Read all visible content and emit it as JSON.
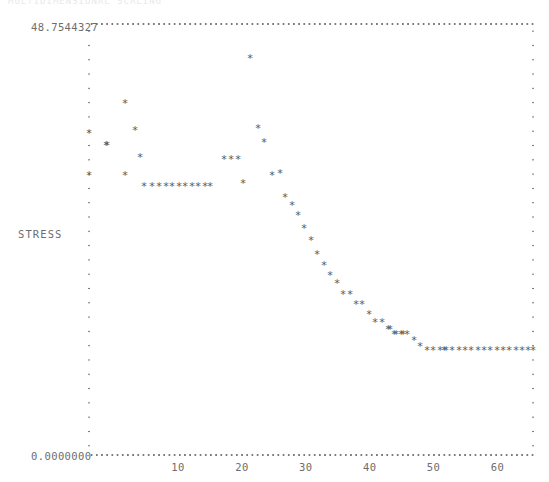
{
  "header": {
    "clipped_text": "MULTIDIMENSIONAL SCALING"
  },
  "axes": {
    "y_max_label": "48.7544327",
    "y_min_label": "0.0000000",
    "y_axis_title": "STRESS",
    "x_tick_labels": [
      "10",
      "20",
      "30",
      "40",
      "50",
      "60",
      "70"
    ],
    "marker_glyph": "*",
    "frame_color": "#7a7a7a",
    "marker_color": "#5a5a5a",
    "text_color": "#6d6d6d"
  },
  "chart_data": {
    "type": "scatter",
    "title": "",
    "xlabel": "",
    "ylabel": "STRESS",
    "xlim": [
      0,
      70
    ],
    "ylim": [
      0.0,
      48.7544327
    ],
    "grid": false,
    "legend": "none",
    "xticks": [
      10,
      20,
      30,
      40,
      50,
      60,
      70
    ],
    "yticks": [
      0.0,
      48.7544327
    ],
    "marker": "*",
    "x": [
      1,
      1,
      2,
      3,
      3,
      4,
      5,
      6,
      7,
      8,
      9,
      10,
      11,
      12,
      13,
      14,
      15,
      16,
      17,
      18,
      19,
      20,
      21,
      22,
      23,
      24,
      25,
      26,
      27,
      28,
      29,
      30,
      31,
      32,
      33,
      34,
      35,
      36,
      37,
      38,
      39,
      40,
      41,
      42,
      43,
      44,
      45,
      46,
      47,
      48,
      49,
      50,
      51,
      52,
      53,
      54,
      55,
      56,
      57,
      58,
      59,
      60,
      61,
      62,
      63,
      64,
      65,
      66,
      67,
      68,
      69,
      70
    ],
    "y": [
      35.6,
      32.1,
      32.1,
      37.9,
      32.1,
      36.3,
      34.0,
      32.1,
      30.3,
      30.3,
      30.3,
      30.3,
      30.3,
      30.3,
      30.3,
      30.3,
      30.3,
      30.3,
      32.8,
      32.8,
      32.8,
      30.3,
      30.3,
      34.7,
      44.7,
      35.6,
      34.0,
      30.8,
      30.3,
      28.4,
      27.5,
      26.3,
      25.0,
      23.2,
      21.8,
      20.8,
      19.9,
      18.5,
      18.5,
      17.2,
      17.2,
      16.0,
      15.3,
      15.3,
      14.4,
      13.8,
      13.8,
      13.8,
      13.1,
      12.4,
      11.9,
      11.9,
      11.9,
      11.9,
      11.9,
      11.9,
      11.9,
      11.9,
      11.9,
      11.9,
      11.9,
      11.9,
      11.9,
      11.9,
      11.9,
      11.9,
      11.9,
      11.9,
      11.9,
      11.9,
      11.9,
      11.9
    ],
    "points_px": [
      [
        89,
        133
      ],
      [
        89,
        175
      ],
      [
        106,
        145
      ],
      [
        125,
        103
      ],
      [
        107,
        145
      ],
      [
        135,
        130
      ],
      [
        140,
        157
      ],
      [
        125,
        175
      ],
      [
        144,
        186
      ],
      [
        152,
        186
      ],
      [
        159,
        186
      ],
      [
        166,
        186
      ],
      [
        172,
        186
      ],
      [
        179,
        186
      ],
      [
        185,
        186
      ],
      [
        192,
        186
      ],
      [
        198,
        186
      ],
      [
        205,
        186
      ],
      [
        224,
        159
      ],
      [
        231,
        159
      ],
      [
        238,
        159
      ],
      [
        210,
        186
      ],
      [
        243,
        183
      ],
      [
        258,
        128
      ],
      [
        250,
        58
      ],
      [
        264,
        142
      ],
      [
        272,
        175
      ],
      [
        280,
        173
      ],
      [
        285,
        197
      ],
      [
        292,
        205
      ],
      [
        298,
        215
      ],
      [
        304,
        228
      ],
      [
        311,
        240
      ],
      [
        317,
        254
      ],
      [
        324,
        265
      ],
      [
        330,
        275
      ],
      [
        337,
        283
      ],
      [
        343,
        294
      ],
      [
        350,
        294
      ],
      [
        356,
        304
      ],
      [
        362,
        304
      ],
      [
        369,
        314
      ],
      [
        375,
        322
      ],
      [
        382,
        322
      ],
      [
        388,
        329
      ],
      [
        394,
        334
      ],
      [
        401,
        334
      ],
      [
        407,
        334
      ],
      [
        414,
        340
      ],
      [
        420,
        346
      ],
      [
        427,
        350
      ],
      [
        433,
        350
      ],
      [
        440,
        350
      ],
      [
        446,
        350
      ],
      [
        452,
        350
      ],
      [
        459,
        350
      ],
      [
        465,
        350
      ],
      [
        471,
        350
      ],
      [
        478,
        350
      ],
      [
        484,
        350
      ],
      [
        490,
        350
      ],
      [
        497,
        350
      ],
      [
        503,
        350
      ],
      [
        509,
        350
      ],
      [
        516,
        350
      ],
      [
        522,
        350
      ],
      [
        528,
        350
      ],
      [
        533,
        350
      ],
      [
        403,
        334
      ],
      [
        396,
        334
      ],
      [
        390,
        329
      ],
      [
        444,
        350
      ]
    ]
  }
}
